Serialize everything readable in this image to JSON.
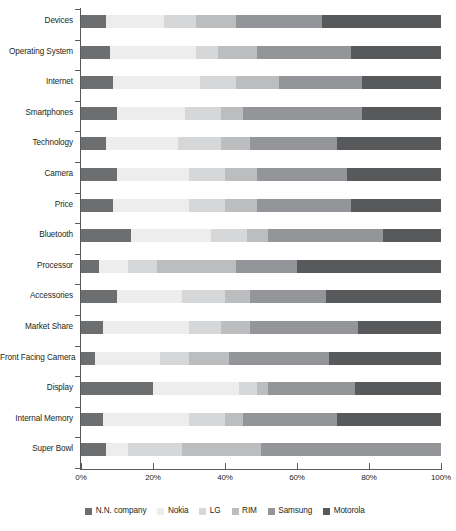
{
  "chart_data": {
    "type": "bar",
    "orientation": "horizontal",
    "stacked": true,
    "normalized": true,
    "title": "",
    "xlabel": "",
    "ylabel": "",
    "xlim": [
      0,
      100
    ],
    "xticks": [
      0,
      20,
      40,
      60,
      80,
      100
    ],
    "xtick_labels": [
      "0%",
      "20%",
      "40%",
      "60%",
      "80%",
      "100%"
    ],
    "grid": false,
    "legend_position": "bottom",
    "categories": [
      "Devices",
      "Operating System",
      "Internet",
      "Smartphones",
      "Technology",
      "Camera",
      "Price",
      "Bluetooth",
      "Processor",
      "Accessories",
      "Market Share",
      "Front Facing Camera",
      "Display",
      "Internal Memory",
      "Super Bowl"
    ],
    "series": [
      {
        "name": "N.N. company",
        "color": "#6d6e70",
        "values": [
          7,
          8,
          9,
          10,
          7,
          10,
          9,
          14,
          5,
          10,
          6,
          4,
          20,
          6,
          7
        ]
      },
      {
        "name": "Nokia",
        "color": "#ededed",
        "values": [
          16,
          24,
          24,
          19,
          20,
          20,
          21,
          22,
          8,
          18,
          24,
          18,
          24,
          24,
          6
        ]
      },
      {
        "name": "LG",
        "color": "#d6d7d8",
        "values": [
          9,
          6,
          10,
          10,
          12,
          10,
          10,
          10,
          8,
          12,
          9,
          8,
          5,
          10,
          15
        ]
      },
      {
        "name": "RIM",
        "color": "#bbbdbf",
        "values": [
          11,
          11,
          12,
          6,
          8,
          9,
          9,
          6,
          22,
          7,
          8,
          11,
          3,
          5,
          22
        ]
      },
      {
        "name": "Samsung",
        "color": "#939598",
        "values": [
          24,
          26,
          23,
          33,
          24,
          25,
          26,
          32,
          17,
          21,
          30,
          28,
          24,
          26,
          50
        ]
      },
      {
        "name": "Motorola",
        "color": "#58595b",
        "values": [
          33,
          25,
          22,
          22,
          29,
          26,
          25,
          16,
          40,
          32,
          23,
          31,
          24,
          29,
          0
        ]
      }
    ]
  }
}
